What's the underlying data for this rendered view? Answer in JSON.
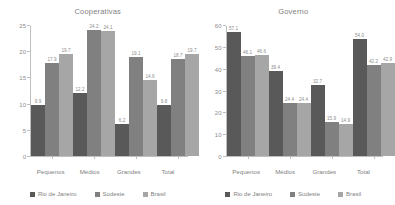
{
  "colors": {
    "series": [
      "#595959",
      "#808080",
      "#a6a6a6"
    ],
    "axis": "#bfbfbf",
    "text": "#7f7f7f",
    "background": "#ffffff"
  },
  "legend": {
    "items": [
      {
        "label": "Rio de Janeiro",
        "color": "#595959"
      },
      {
        "label": "Sudeste",
        "color": "#808080"
      },
      {
        "label": "Brasil",
        "color": "#a6a6a6"
      }
    ]
  },
  "charts": [
    {
      "title": "Cooperativas",
      "yticks": [
        "0",
        "5",
        "10",
        "15",
        "20",
        "25"
      ]
    },
    {
      "title": "Governo",
      "yticks": [
        "0",
        "10",
        "20",
        "30",
        "40",
        "50",
        "60"
      ]
    }
  ],
  "categories": [
    "Pequenos",
    "Médios",
    "Grandes",
    "Total"
  ],
  "chart_data": [
    {
      "type": "bar",
      "title": "Cooperativas",
      "xlabel": "",
      "ylabel": "",
      "ylim": [
        0,
        25
      ],
      "yticks": [
        0,
        5,
        10,
        15,
        20,
        25
      ],
      "grid": false,
      "legend_position": "bottom",
      "categories": [
        "Pequenos",
        "Médios",
        "Grandes",
        "Total"
      ],
      "series": [
        {
          "name": "Rio de Janeiro",
          "color": "#595959",
          "values": [
            9.9,
            12.2,
            6.2,
            9.8
          ]
        },
        {
          "name": "Sudeste",
          "color": "#808080",
          "values": [
            17.9,
            24.2,
            19.1,
            18.7
          ]
        },
        {
          "name": "Brasil",
          "color": "#a6a6a6",
          "values": [
            19.7,
            24.1,
            14.6,
            19.7
          ]
        }
      ],
      "data_labels": [
        [
          "9.9",
          "17.9",
          "19.7"
        ],
        [
          "12.2",
          "24.2",
          "24.1"
        ],
        [
          "6.2",
          "19.1",
          "14.6"
        ],
        [
          "9.8",
          "18.7",
          "19.7"
        ]
      ]
    },
    {
      "type": "bar",
      "title": "Governo",
      "xlabel": "",
      "ylabel": "",
      "ylim": [
        0,
        60
      ],
      "yticks": [
        0,
        10,
        20,
        30,
        40,
        50,
        60
      ],
      "grid": false,
      "legend_position": "bottom",
      "categories": [
        "Pequenos",
        "Médios",
        "Grandes",
        "Total"
      ],
      "series": [
        {
          "name": "Rio de Janeiro",
          "color": "#595959",
          "values": [
            57.1,
            39.4,
            32.7,
            54.0
          ]
        },
        {
          "name": "Sudeste",
          "color": "#808080",
          "values": [
            46.1,
            24.4,
            15.9,
            42.2
          ]
        },
        {
          "name": "Brasil",
          "color": "#a6a6a6",
          "values": [
            46.6,
            24.4,
            14.9,
            42.9
          ]
        }
      ],
      "data_labels": [
        [
          "57.1",
          "46.1",
          "46.6"
        ],
        [
          "39.4",
          "24.4",
          "24.4"
        ],
        [
          "32.7",
          "15.9",
          "14.9"
        ],
        [
          "54.0",
          "42.2",
          "42.9"
        ]
      ]
    }
  ]
}
